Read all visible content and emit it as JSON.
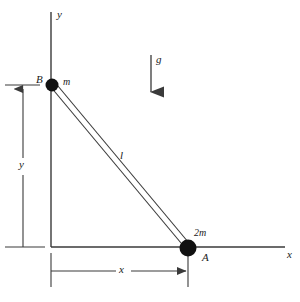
{
  "figure": {
    "background_color": "#ffffff",
    "stroke_color": "#3a3a3a",
    "mass_color": "#111111"
  },
  "axes": {
    "x_label": "x",
    "y_label": "y",
    "origin": {
      "x": 51,
      "y": 247
    },
    "x_axis_end": {
      "x": 285,
      "y": 247
    },
    "y_axis_top": {
      "x": 51,
      "y": 12
    }
  },
  "masses": [
    {
      "id": "B",
      "point_label": "B",
      "mass_label": "m",
      "center": {
        "x": 52,
        "y": 85
      },
      "radius": 6.5
    },
    {
      "id": "A",
      "point_label": "A",
      "mass_label": "2m",
      "center": {
        "x": 188,
        "y": 248
      },
      "radius": 8.5
    }
  ],
  "rod": {
    "label": "l",
    "from": {
      "x": 52,
      "y": 85
    },
    "to": {
      "x": 188,
      "y": 248
    }
  },
  "gravity": {
    "label": "g",
    "arrow_x": 151,
    "arrow_top_y": 55,
    "arrow_bottom_y": 100
  },
  "dimensions": [
    {
      "name": "vertical-height",
      "label": "y",
      "line_x": 23,
      "top_y": 85,
      "bottom_y": 247
    },
    {
      "name": "horizontal-distance",
      "label": "x",
      "line_y": 271,
      "left_x": 51,
      "right_x": 188
    }
  ]
}
